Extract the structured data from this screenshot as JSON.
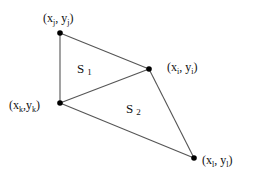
{
  "diagram": {
    "type": "triangle-mesh",
    "edge_color": "#555555",
    "point_color": "#000000",
    "points": [
      {
        "id": "j",
        "x": 60,
        "y": 33,
        "label": {
          "base_x": "x",
          "sub_x": "j",
          "base_y": "y",
          "sub_y": "j"
        }
      },
      {
        "id": "i",
        "x": 149,
        "y": 69,
        "label": {
          "base_x": "x",
          "sub_x": "i",
          "base_y": "y",
          "sub_y": "i"
        }
      },
      {
        "id": "k",
        "x": 60,
        "y": 103,
        "label": {
          "base_x": "x",
          "sub_x": "k",
          "base_y": "y",
          "sub_y": "k"
        }
      },
      {
        "id": "l",
        "x": 194,
        "y": 158,
        "label": {
          "base_x": "x",
          "sub_x": "l",
          "base_y": "y",
          "sub_y": "l"
        }
      }
    ],
    "edges": [
      [
        "j",
        "i"
      ],
      [
        "j",
        "k"
      ],
      [
        "k",
        "i"
      ],
      [
        "k",
        "l"
      ],
      [
        "i",
        "l"
      ]
    ],
    "regions": [
      {
        "id": "S1",
        "base": "S",
        "sub": "1"
      },
      {
        "id": "S2",
        "base": "S",
        "sub": "2"
      }
    ]
  }
}
